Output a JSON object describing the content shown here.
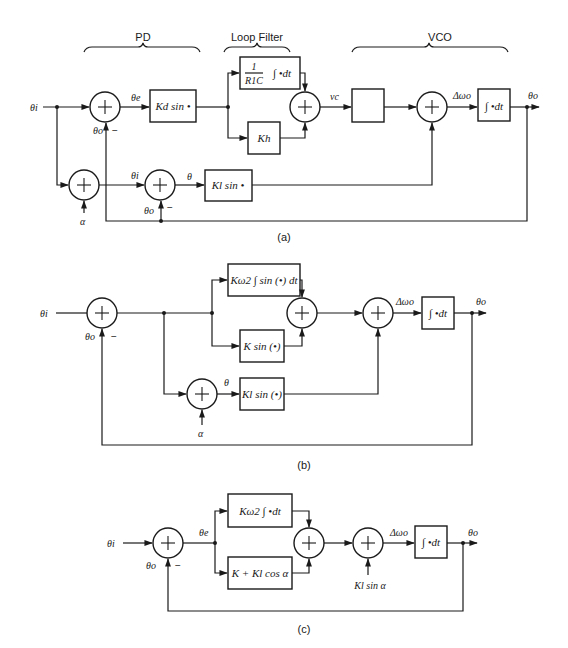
{
  "diagram_a": {
    "caption": "(a)",
    "sections": {
      "pd": "PD",
      "loop_filter": "Loop Filter",
      "vco": "VCO"
    },
    "signals": {
      "input": "θi",
      "error": "θe",
      "output": "θo",
      "feedback_top": "θo",
      "minus_top": "−",
      "vc": "vc",
      "delta_omega": "Δωo",
      "theta_i_lower": "θi",
      "theta_lower": "θ",
      "feedback_lower": "θo",
      "minus_lower": "−",
      "alpha": "α"
    },
    "blocks": {
      "kd": "Kd sin •",
      "integ_coef_num": "1",
      "integ_coef_den": "R1C",
      "integ_expr": "∫ •dt",
      "kh": "Kh",
      "vco_gain": "",
      "integrator": "∫ •dt",
      "kl": "Kl sin •"
    }
  },
  "diagram_b": {
    "caption": "(b)",
    "signals": {
      "input": "θi",
      "feedback": "θo",
      "minus": "−",
      "theta": "θ",
      "alpha": "α",
      "delta_omega": "Δωo",
      "output": "θo"
    },
    "blocks": {
      "k_omega": "Kω2 ∫ sin (•) dt",
      "k_sin": "K sin (•)",
      "kl_sin": "Kl sin (•)",
      "integrator": "∫ •dt"
    }
  },
  "diagram_c": {
    "caption": "(c)",
    "signals": {
      "input": "θi",
      "error": "θe",
      "feedback": "θo",
      "minus": "−",
      "delta_omega": "Δωo",
      "output": "θo",
      "kl_sin_alpha": "Kl sin α"
    },
    "blocks": {
      "k_omega": "Kω2 ∫ •dt",
      "k_cos": "K + Kl cos α",
      "integrator": "∫ •dt"
    }
  }
}
